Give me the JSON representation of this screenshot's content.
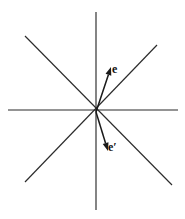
{
  "figure": {
    "type": "vector-diagram",
    "title": "",
    "background_color": "#ffffff",
    "width": 185,
    "height": 219,
    "origin": {
      "x": 96,
      "y": 112
    },
    "line_color": "#2b2b2b",
    "vector_color": "#1a1a1a",
    "label_color": "#111111",
    "axes": [
      {
        "name": "horizontal-axis",
        "x1": 8,
        "y1": 110,
        "x2": 178,
        "y2": 110
      },
      {
        "name": "vertical-axis",
        "x1": 96,
        "y1": 12,
        "x2": 96,
        "y2": 210
      },
      {
        "name": "diagonal-nw-se-axis",
        "x1": 25,
        "y1": 36,
        "x2": 172,
        "y2": 185
      },
      {
        "name": "diagonal-sw-ne-axis",
        "x1": 25,
        "y1": 182,
        "x2": 157,
        "y2": 45
      }
    ],
    "vectors": [
      {
        "name": "vector-e",
        "label": "e",
        "x1": 96,
        "y1": 112,
        "x2": 111,
        "y2": 67,
        "label_x": 112,
        "label_y": 63
      },
      {
        "name": "vector-e-prime",
        "label": "e′",
        "x1": 96,
        "y1": 112,
        "x2": 108,
        "y2": 151,
        "label_x": 108,
        "label_y": 141
      }
    ]
  }
}
